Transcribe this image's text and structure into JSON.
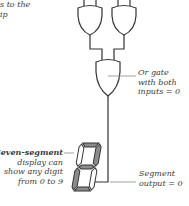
{
  "diagram": {
    "top_left_caption": {
      "lines": [
        "s to the",
        "ip"
      ]
    },
    "or_gate_label": {
      "lines": [
        "Or gate",
        "with both",
        "inputs = 0"
      ]
    },
    "display_label": {
      "bold_part": "Seven-segment",
      "lines": [
        "display can",
        "show any digit",
        "from 0 to 9"
      ]
    },
    "segment_output_label": {
      "lines": [
        "Segment",
        "output = 0"
      ]
    },
    "seven_segment_display": {
      "segments_lit": {
        "a": true,
        "b": true,
        "c": false,
        "d": true,
        "e": true,
        "f": false,
        "g": true
      },
      "lit_color": "#8c8c8c",
      "unlit_color": "#ffffff"
    },
    "colors": {
      "line": "#333333",
      "leader": "#888888",
      "text": "#3a3a3a"
    }
  }
}
